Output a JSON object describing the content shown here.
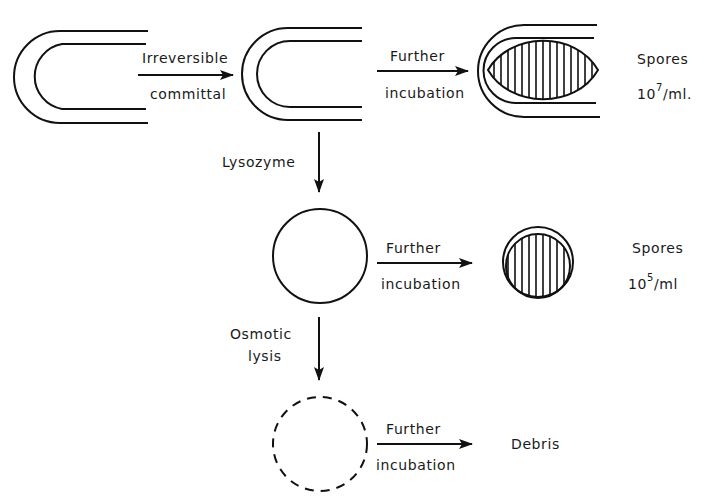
{
  "diagram": {
    "type": "process-flow",
    "stages": {
      "cell_initial": {
        "shape": "double-walled rod (open end)"
      },
      "cell_committed": {
        "shape": "double-walled rod (open end)"
      },
      "cell_with_spore": {
        "shape": "double-walled rod containing hatched forespore"
      },
      "protoplast": {
        "shape": "solid circle"
      },
      "protoplast_spore": {
        "shape": "circle containing hatched spore"
      },
      "lysed": {
        "shape": "dashed circle"
      }
    },
    "arrows": {
      "committal": {
        "line1": "Irreversible",
        "line2": "committal"
      },
      "incubation_top": {
        "line1": "Further",
        "line2": "incubation"
      },
      "lysozyme": {
        "label": "Lysozyme"
      },
      "incubation_middle": {
        "line1": "Further",
        "line2": "incubation"
      },
      "osmotic": {
        "line1": "Osmotic",
        "line2": "lysis"
      },
      "incubation_bottom": {
        "line1": "Further",
        "line2": "incubation"
      }
    },
    "outcomes": {
      "top": {
        "label": "Spores",
        "base": "10",
        "exponent": "7",
        "unit": "/ml."
      },
      "middle": {
        "label": "Spores",
        "base": "10",
        "exponent": "5",
        "unit": "/ml"
      },
      "bottom": {
        "label": "Debris"
      }
    }
  }
}
